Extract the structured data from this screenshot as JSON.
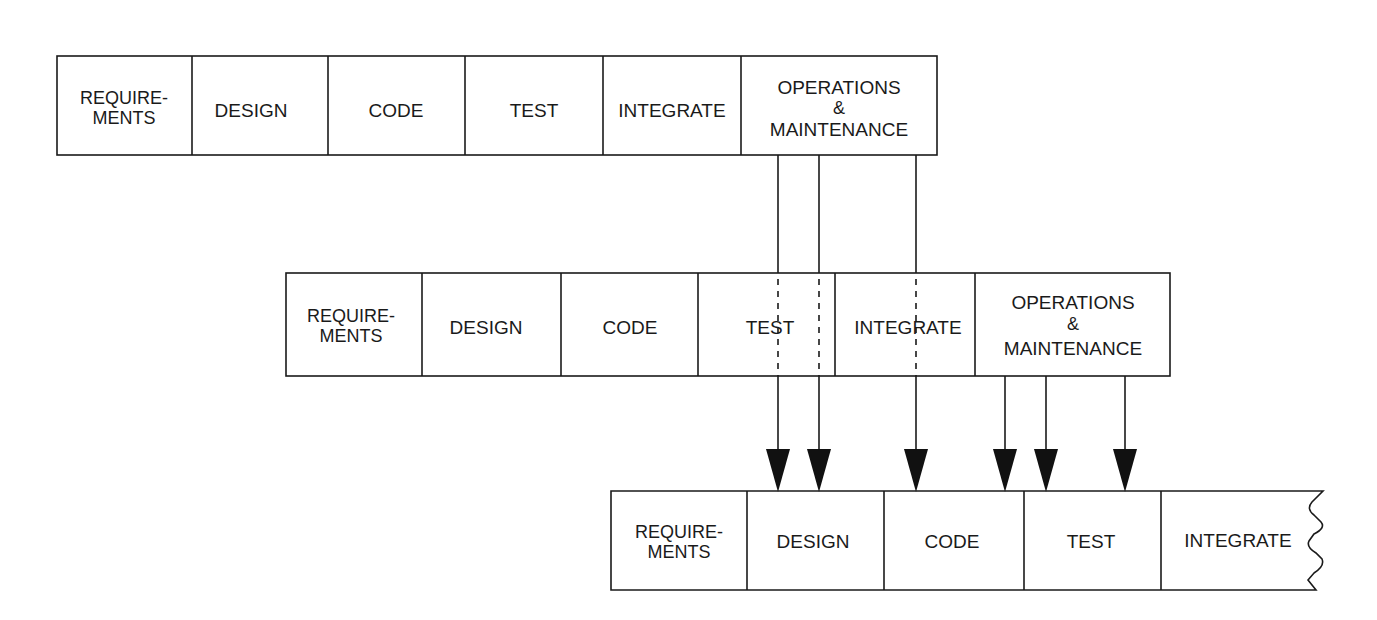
{
  "diagram": {
    "type": "iterative waterfall / overlapping lifecycle phases",
    "rows": [
      {
        "id": "cycle-1",
        "phases": [
          {
            "label_line1": "REQUIRE-",
            "label_line2": "MENTS"
          },
          {
            "label": "DESIGN"
          },
          {
            "label": "CODE"
          },
          {
            "label": "TEST"
          },
          {
            "label": "INTEGRATE"
          },
          {
            "label_line1": "OPERATIONS",
            "label_amp": "&",
            "label_line2": "MAINTENANCE"
          }
        ]
      },
      {
        "id": "cycle-2",
        "phases": [
          {
            "label_line1": "REQUIRE-",
            "label_line2": "MENTS"
          },
          {
            "label": "DESIGN"
          },
          {
            "label": "CODE"
          },
          {
            "label": "TEST"
          },
          {
            "label": "INTEGRATE"
          },
          {
            "label_line1": "OPERATIONS",
            "label_amp": "&",
            "label_line2": "MAINTENANCE"
          }
        ]
      },
      {
        "id": "cycle-3",
        "continues": true,
        "phases": [
          {
            "label_line1": "REQUIRE-",
            "label_line2": "MENTS"
          },
          {
            "label": "DESIGN"
          },
          {
            "label": "CODE"
          },
          {
            "label": "TEST"
          },
          {
            "label": "INTEGRATE"
          }
        ]
      }
    ],
    "arrows": [
      {
        "from": "cycle-1 OPERATIONS & MAINTENANCE",
        "to": "cycle-3 DESIGN"
      },
      {
        "from": "cycle-1 OPERATIONS & MAINTENANCE",
        "to": "cycle-3 DESIGN"
      },
      {
        "from": "cycle-1 OPERATIONS & MAINTENANCE",
        "to": "cycle-3 CODE"
      },
      {
        "from": "cycle-2 OPERATIONS & MAINTENANCE",
        "to": "cycle-3 CODE"
      },
      {
        "from": "cycle-2 OPERATIONS & MAINTENANCE",
        "to": "cycle-3 TEST"
      },
      {
        "from": "cycle-2 OPERATIONS & MAINTENANCE",
        "to": "cycle-3 TEST"
      }
    ],
    "colors": {
      "line": "#1a1a1a",
      "background": "#ffffff"
    }
  }
}
